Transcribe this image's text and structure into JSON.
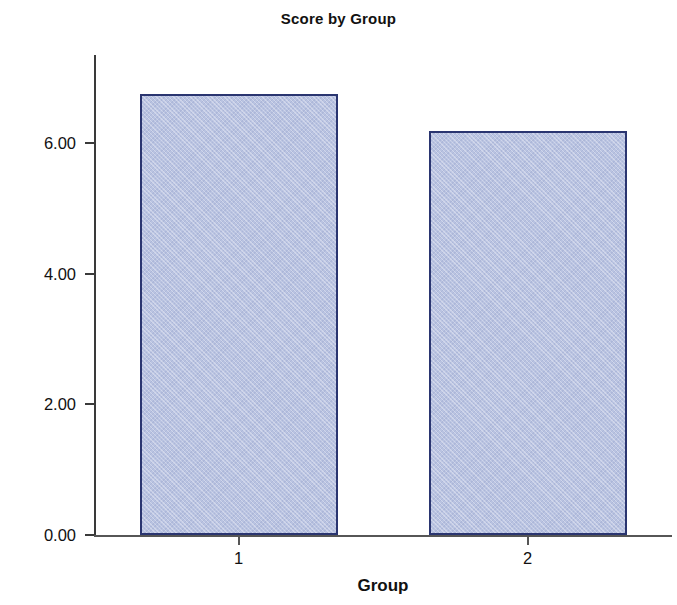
{
  "chart_data": {
    "type": "bar",
    "title": "Score by Group",
    "xlabel": "Group",
    "ylabel": "Mean Score",
    "categories": [
      "1",
      "2"
    ],
    "values": [
      6.76,
      6.19
    ],
    "ylim": [
      0,
      7.35
    ],
    "yticks": [
      0,
      2,
      4,
      6
    ],
    "ytick_labels": [
      "0.00",
      "2.00",
      "4.00",
      "6.00"
    ],
    "grid": false,
    "legend": null,
    "series": [
      {
        "name": "Mean Score",
        "values": [
          6.76,
          6.19
        ]
      }
    ],
    "style": {
      "bar_fill": "#b9c3e1",
      "bar_border": "#2a3570",
      "axis_color": "#3a3a3a",
      "background": "#ffffff",
      "text_color": "#111111"
    }
  }
}
